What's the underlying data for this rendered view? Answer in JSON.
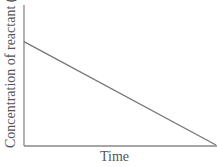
{
  "chart_data": {
    "type": "line",
    "title": "",
    "xlabel": "Time",
    "ylabel": "Concentration of reactant (M)",
    "ylabel_parts": {
      "text": "Concentration of reactant (",
      "unit": "M",
      "close": ")"
    },
    "x": [
      0,
      1
    ],
    "series": [
      {
        "name": "Reactant concentration",
        "values": [
          0.74,
          0.0
        ]
      }
    ],
    "xlim": [
      0,
      1
    ],
    "ylim": [
      0,
      1
    ],
    "grid": false,
    "legend": "none",
    "ticks": "none",
    "colors": {
      "axis": "#888888",
      "line": "#777777",
      "text": "#555555"
    }
  }
}
